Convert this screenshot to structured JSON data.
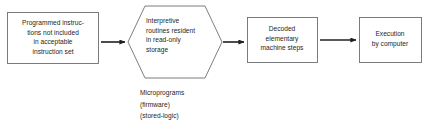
{
  "diagram": {
    "colors": {
      "background": "#ffffff",
      "stroke": "#6d6e71",
      "arrow": "#231f20",
      "text": "#231f20"
    },
    "nodes": [
      {
        "id": "programmed-instructions",
        "shape": "rectangle",
        "label": "Programmed instruc-\ntions not included\nin acceptable\ninstruction set"
      },
      {
        "id": "interpretive-routines",
        "shape": "hexagon",
        "label": "Interpretive\nroutines resident\nin read-only\nstorage"
      },
      {
        "id": "decoded-machine-steps",
        "shape": "rectangle",
        "label": "Decoded\nelementary\nmachine steps"
      },
      {
        "id": "execution-by-computer",
        "shape": "rectangle",
        "label": "Execution\nby computer"
      }
    ],
    "caption": {
      "id": "microprograms-caption",
      "text": "Microprograms\n(firmware)\n(stored-logic)"
    },
    "connectors": [
      {
        "id": "arrow-1",
        "from": "programmed-instructions",
        "to": "interpretive-routines"
      },
      {
        "id": "arrow-2",
        "from": "interpretive-routines",
        "to": "decoded-machine-steps"
      },
      {
        "id": "arrow-3",
        "from": "decoded-machine-steps",
        "to": "execution-by-computer"
      }
    ]
  }
}
